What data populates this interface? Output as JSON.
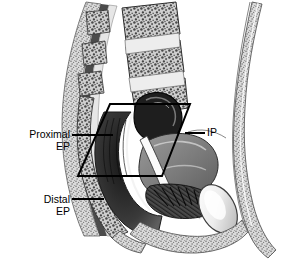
{
  "figure": {
    "modality": "grayscale anatomical line illustration",
    "background_color": "#ffffff",
    "ink_color": "#000000",
    "width": 298,
    "height": 265
  },
  "annotations": {
    "proximal_ep": {
      "label": "Proximal\nEP",
      "line1": "Proximal",
      "line2": "EP",
      "meaning": "Proximal external pressure zone",
      "align": "right",
      "leader_from": [
        72,
        135
      ],
      "leader_to": [
        113,
        135
      ]
    },
    "distal_ep": {
      "label": "Distal\nEP",
      "line1": "Distal",
      "line2": "EP",
      "meaning": "Distal external pressure zone",
      "align": "right",
      "leader_from": [
        72,
        199
      ],
      "leader_to": [
        104,
        199
      ]
    },
    "ip": {
      "label": "IP",
      "line1": "IP",
      "meaning": "Intrinsic pressure zone",
      "align": "left",
      "leader_from": [
        185,
        133
      ],
      "leader_to": [
        205,
        133
      ]
    }
  },
  "overlay": {
    "shape": "parallelogram",
    "stroke_color": "#000000",
    "stroke_width": 2,
    "fill": "none",
    "points": "110,104 190,104 162,176 78,176"
  },
  "structures": [
    {
      "name": "lumbar-vertebrae",
      "region": "upper-left",
      "shading": "trabecular-bone-stipple"
    },
    {
      "name": "intervertebral-discs",
      "region": "upper-left",
      "shading": "light-banded"
    },
    {
      "name": "sacrum",
      "region": "left-mid",
      "shading": "stippled-bone"
    },
    {
      "name": "coccyx",
      "region": "lower-left",
      "shading": "stippled-bone"
    },
    {
      "name": "spinal-canal",
      "region": "upper-left",
      "shading": "dark-band"
    },
    {
      "name": "urinary-bladder",
      "region": "center",
      "shading": "dark-hollow"
    },
    {
      "name": "urethra",
      "region": "center-lower",
      "shading": "light-channel"
    },
    {
      "name": "vagina",
      "region": "center",
      "shading": "mid-gray-folded"
    },
    {
      "name": "rectum",
      "region": "center-left",
      "shading": "dark-folded-lumen"
    },
    {
      "name": "anal-canal",
      "region": "lower-center",
      "shading": "dark-striated"
    },
    {
      "name": "pubic-symphysis",
      "region": "lower-right",
      "shading": "light-oval"
    },
    {
      "name": "abdominal-wall",
      "region": "right",
      "shading": "stippled-band"
    },
    {
      "name": "perineal-body",
      "region": "lower-center",
      "shading": "mid-gray"
    }
  ],
  "caption": {
    "visible_fragment": ""
  }
}
